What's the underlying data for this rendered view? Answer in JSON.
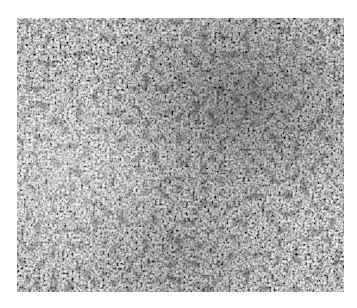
{
  "image": {
    "kind": "grayscale micrograph",
    "description": "Grainy grayscale texture with denser dark speckles toward upper-right and lower-center",
    "frame": {
      "x": 17,
      "y": 18,
      "width": 327,
      "height": 274
    },
    "colors": {
      "background": "#ffffff",
      "base_gray": "#a9a9a9",
      "dark_speck": "#2a2a2a",
      "light_grain": "#e6e6e6"
    }
  }
}
